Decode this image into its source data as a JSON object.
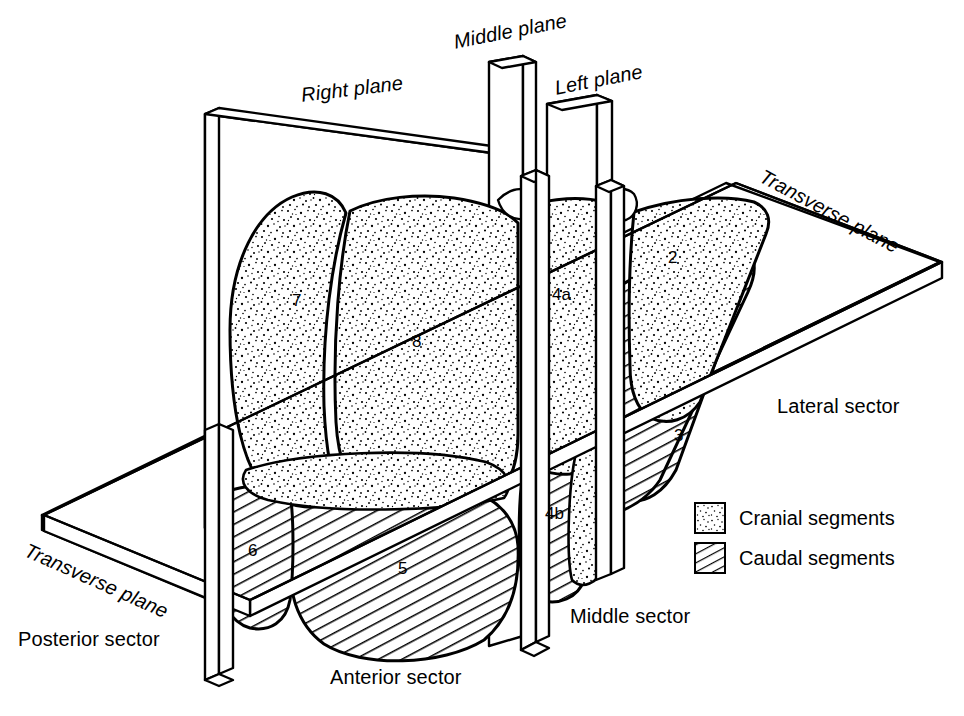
{
  "figure": {
    "background_color": "#ffffff",
    "line_color": "#000000"
  },
  "planes": [
    {
      "id": "right-plane",
      "label": "Right plane",
      "x": 300,
      "y": 85,
      "rotate": -7
    },
    {
      "id": "middle-plane",
      "label": "Middle plane",
      "x": 452,
      "y": 32,
      "rotate": -11
    },
    {
      "id": "left-plane",
      "label": "Left plane",
      "x": 553,
      "y": 78,
      "rotate": -11
    },
    {
      "id": "transverse-plane-right",
      "label": "Transverse plane",
      "x": 766,
      "y": 166,
      "rotate": 28
    },
    {
      "id": "transverse-plane-left",
      "label": "Transverse plane",
      "x": 30,
      "y": 540,
      "rotate": 24
    }
  ],
  "sectors": [
    {
      "id": "lateral-sector",
      "label": "Lateral sector",
      "x": 777,
      "y": 396
    },
    {
      "id": "middle-sector",
      "label": "Middle sector",
      "x": 570,
      "y": 606
    },
    {
      "id": "posterior-sector",
      "label": "Posterior sector",
      "x": 18,
      "y": 629
    },
    {
      "id": "anterior-sector",
      "label": "Anterior sector",
      "x": 330,
      "y": 667
    }
  ],
  "segments": [
    {
      "number": "7",
      "group": "cranial",
      "x": 292,
      "y": 292
    },
    {
      "number": "8",
      "group": "cranial",
      "x": 412,
      "y": 333
    },
    {
      "number": "4a",
      "group": "cranial",
      "x": 552,
      "y": 286
    },
    {
      "number": "2",
      "group": "cranial",
      "x": 668,
      "y": 249
    },
    {
      "number": "3",
      "group": "caudal",
      "x": 674,
      "y": 427
    },
    {
      "number": "4b",
      "group": "caudal",
      "x": 545,
      "y": 505
    },
    {
      "number": "5",
      "group": "caudal",
      "x": 398,
      "y": 560
    },
    {
      "number": "6",
      "group": "caudal",
      "x": 248,
      "y": 542
    }
  ],
  "legend": {
    "items": [
      {
        "id": "cranial-segments",
        "label": "Cranial segments",
        "pattern": "stipple"
      },
      {
        "id": "caudal-segments",
        "label": "Caudal segments",
        "pattern": "hatch"
      }
    ]
  }
}
